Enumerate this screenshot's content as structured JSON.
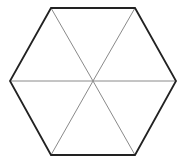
{
  "diagram": {
    "type": "hexagon-divided-into-triangles",
    "shape": "regular hexagon",
    "triangle_count": 6,
    "center": [
      93,
      81
    ],
    "vertices": [
      [
        51,
        8
      ],
      [
        135,
        8
      ],
      [
        176,
        81
      ],
      [
        135,
        155
      ],
      [
        51,
        155
      ],
      [
        10,
        81
      ]
    ],
    "colors": {
      "background": "#ffffff",
      "outline": "#222222",
      "inner_lines": "#8a8a8a"
    },
    "stroke_widths": {
      "outline": 1.8,
      "inner_lines": 1
    }
  }
}
